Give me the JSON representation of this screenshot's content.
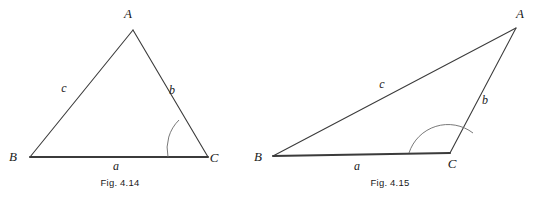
{
  "page": {
    "background_color": "#ffffff",
    "line_color": "#3b3b3b",
    "arc_color": "#6a6a6a",
    "text_color": "#1a1a1a"
  },
  "figures": [
    {
      "id": "fig-4-14",
      "caption": "Fig. 4.14",
      "caption_pos": {
        "x": 120,
        "y": 186
      },
      "shape": "triangle",
      "angle_type": "acute",
      "vertices": [
        {
          "name": "A",
          "x": 133,
          "y": 30,
          "label": "A",
          "label_x": 128,
          "label_y": 18
        },
        {
          "name": "B",
          "x": 30,
          "y": 157,
          "label": "B",
          "label_x": 13,
          "label_y": 161
        },
        {
          "name": "C",
          "x": 208,
          "y": 157,
          "label": "C",
          "label_x": 214,
          "label_y": 162
        }
      ],
      "sides": [
        {
          "name": "a",
          "from": "B",
          "to": "C",
          "label": "a",
          "label_x": 116,
          "label_y": 170,
          "emphasis": "thick"
        },
        {
          "name": "b",
          "from": "A",
          "to": "C",
          "label": "b",
          "label_x": 172,
          "label_y": 94,
          "emphasis": "thin"
        },
        {
          "name": "c",
          "from": "A",
          "to": "B",
          "label": "c",
          "label_x": 64,
          "label_y": 92,
          "emphasis": "thin"
        }
      ],
      "angle_arc": {
        "at_vertex": "C",
        "radius": 40,
        "start_x": 168,
        "start_y": 157,
        "end_x": 179,
        "end_y": 120,
        "sweep": 1
      }
    },
    {
      "id": "fig-4-15",
      "caption": "Fig. 4.15",
      "caption_pos": {
        "x": 390,
        "y": 186
      },
      "shape": "triangle",
      "angle_type": "obtuse",
      "vertices": [
        {
          "name": "A",
          "x": 516,
          "y": 28,
          "label": "A",
          "label_x": 520,
          "label_y": 18
        },
        {
          "name": "B",
          "x": 273,
          "y": 156,
          "label": "B",
          "label_x": 258,
          "label_y": 161
        },
        {
          "name": "C",
          "x": 450,
          "y": 153,
          "label": "C",
          "label_x": 452,
          "label_y": 168
        }
      ],
      "sides": [
        {
          "name": "a",
          "from": "B",
          "to": "C",
          "label": "a",
          "label_x": 357,
          "label_y": 170,
          "emphasis": "thick"
        },
        {
          "name": "b",
          "from": "A",
          "to": "C",
          "label": "b",
          "label_x": 485,
          "label_y": 104,
          "emphasis": "thin"
        },
        {
          "name": "c",
          "from": "A",
          "to": "B",
          "label": "c",
          "label_x": 382,
          "label_y": 88,
          "emphasis": "thin"
        }
      ],
      "angle_arc": {
        "at_vertex": "C",
        "radius": 41,
        "start_x": 409,
        "start_y": 153,
        "end_x": 473,
        "end_y": 133,
        "sweep": 1
      }
    }
  ]
}
